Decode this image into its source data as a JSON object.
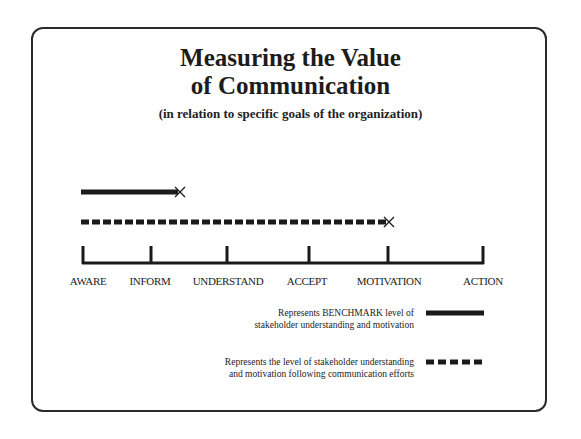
{
  "title": {
    "line1": "Measuring the Value",
    "line2": "of Communication",
    "subtitle": "(in relation to specific goals of the organization)"
  },
  "scale": {
    "stages": [
      "AWARE",
      "INFORM",
      "UNDERSTAND",
      "ACCEPT",
      "MOTIVATION",
      "ACTION"
    ]
  },
  "bars": {
    "benchmark": {
      "style": "solid",
      "from_stage": "AWARE",
      "ends_between": [
        "INFORM",
        "UNDERSTAND"
      ],
      "end_marker": "x"
    },
    "after_communication": {
      "style": "dashed",
      "from_stage": "AWARE",
      "ends_at": "MOTIVATION",
      "end_marker": "x"
    }
  },
  "legend": {
    "benchmark_line1": "Represents BENCHMARK level of",
    "benchmark_line2": "stakeholder understanding and motivation",
    "after_line1": "Represents the level of stakeholder understanding",
    "after_line2": "and motivation following communication efforts"
  },
  "colors": {
    "ink": "#1a1a1a",
    "frame": "#2a2a2a",
    "background": "#ffffff"
  }
}
